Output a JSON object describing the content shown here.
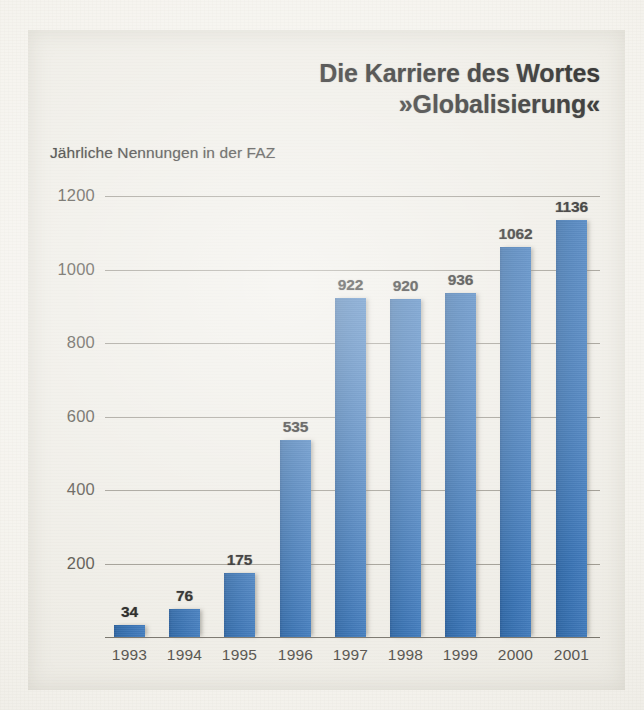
{
  "page": {
    "background_color": "#f4f2ec",
    "panel_color": "#eeece5",
    "bleed_through_lines": [
      "werden sollte, und an diesem Punkt setzt die Kritik",
      "an. Die Globalisierung ist kein Naturereignis.",
      "In Wahrheit ist der Handel ein Vorgang,",
      "der von Menschen gemacht wird.",
      "Wer profitiert von der Globalisierung?",
      "Die Antworten der Ökonomen sind",
      "ebenso unterschiedlich wie die",
      "Interessen, die hinter ihnen stehen.",
      "Die Debatte darüber dauert an."
    ]
  },
  "header": {
    "title_line_1": "Die Karriere des Wortes",
    "title_line_2": "»Globalisierung«",
    "subtitle": "Jährliche Nennungen in der FAZ"
  },
  "chart_data": {
    "type": "bar",
    "title": "Die Karriere des Wortes »Globalisierung«",
    "subtitle": "Jährliche Nennungen in der FAZ",
    "xlabel": "",
    "ylabel": "",
    "categories": [
      "1993",
      "1994",
      "1995",
      "1996",
      "1997",
      "1998",
      "1999",
      "2000",
      "2001"
    ],
    "values": [
      34,
      76,
      175,
      535,
      922,
      920,
      936,
      1062,
      1136
    ],
    "ylim": [
      0,
      1200
    ],
    "yticks": [
      200,
      400,
      600,
      800,
      1000,
      1200
    ],
    "ytick_labels": [
      "200",
      "400",
      "600",
      "800",
      "1000",
      "1200"
    ],
    "grid": true,
    "legend": false,
    "bar_color": "#2262aa",
    "value_labels": [
      "34",
      "76",
      "175",
      "535",
      "922",
      "920",
      "936",
      "1062",
      "1136"
    ]
  }
}
